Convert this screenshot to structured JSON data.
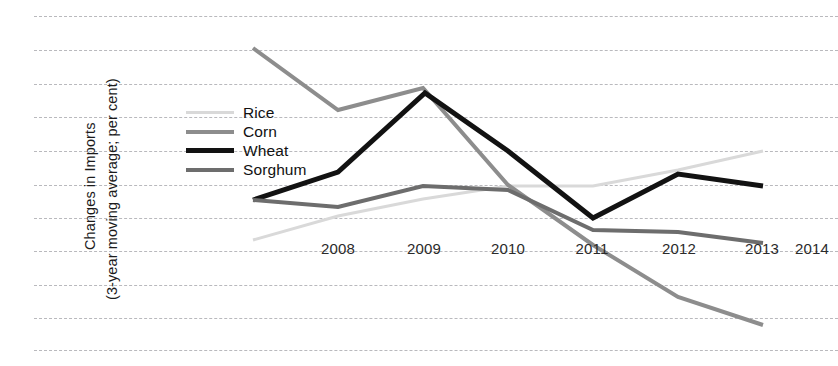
{
  "chart_data": {
    "type": "line",
    "title": "",
    "xlabel": "",
    "ylabel": "Changes in Imports (3-year moving average; per cent)",
    "ylabel_line1": "Changes in Imports",
    "ylabel_line2": "(3-year moving average; per cent)",
    "grid": true,
    "gridlines_y": [
      15,
      10,
      5,
      0,
      -5,
      -10,
      -15,
      -20,
      -25,
      -30,
      -35
    ],
    "ylim": [
      -37,
      17
    ],
    "legend_position": "inside-left",
    "categories": [
      "2007",
      "2008",
      "2009",
      "2010",
      "2011",
      "2012",
      "2013",
      "2014"
    ],
    "tick_labels": [
      "2008",
      "2009",
      "2010",
      "2011",
      "2012",
      "2013",
      "2014"
    ],
    "series": [
      {
        "name": "Rice",
        "color": "#d9d9d9",
        "width": 3,
        "x": [
          "2008",
          "2009",
          "2010",
          "2011",
          "2012",
          "2013",
          "2014"
        ],
        "values": [
          -16.5,
          -9.5,
          -4.5,
          -0.3,
          -0.3,
          2.0,
          5.0
        ]
      },
      {
        "name": "Corn",
        "color": "#8d8d8d",
        "width": 4,
        "x": [
          "2008",
          "2009",
          "2010",
          "2011",
          "2012",
          "2013",
          "2014"
        ],
        "values": [
          20.5,
          11.5,
          14.5,
          0.5,
          -8.5,
          -16.5,
          -21.0
        ]
      },
      {
        "name": "Wheat",
        "color": "#121212",
        "width": 5,
        "x": [
          "2008",
          "2009",
          "2010",
          "2011",
          "2012",
          "2013",
          "2014"
        ],
        "values": [
          -2.3,
          2.0,
          13.8,
          5.0,
          -5.0,
          1.6,
          0.0
        ]
      },
      {
        "name": "Sorghum",
        "color": "#6d6d6d",
        "width": 4,
        "x": [
          "2008",
          "2009",
          "2010",
          "2011",
          "2012",
          "2013",
          "2014"
        ],
        "values": [
          -2.3,
          -3.4,
          -0.3,
          -4.0,
          -7.0,
          -7.3,
          -8.7
        ]
      }
    ]
  },
  "axis": {
    "y_title_line1": "Changes in Imports",
    "y_title_line2": "(3-year moving average; per cent)",
    "ticks": [
      {
        "label": "2008",
        "x": 338
      },
      {
        "label": "2009",
        "x": 424
      },
      {
        "label": "2010",
        "x": 508
      },
      {
        "label": "2011",
        "x": 592
      },
      {
        "label": "2012",
        "x": 679
      },
      {
        "label": "2013",
        "x": 762
      },
      {
        "label": "2014",
        "x": 812
      }
    ],
    "tick_y": 240
  },
  "legend": {
    "items": [
      {
        "label": "Rice",
        "color": "#d9d9d9",
        "thickness": 3
      },
      {
        "label": "Corn",
        "color": "#8d8d8d",
        "thickness": 4
      },
      {
        "label": "Wheat",
        "color": "#121212",
        "thickness": 5
      },
      {
        "label": "Sorghum",
        "color": "#6d6d6d",
        "thickness": 4
      }
    ]
  },
  "geometry": {
    "gridline_px_y": [
      16,
      50,
      84,
      117,
      151,
      185,
      218,
      251,
      285,
      318,
      350
    ],
    "point_px_x": [
      253,
      338,
      423,
      508,
      593,
      678,
      763
    ],
    "series_px": {
      "Rice": [
        240,
        216,
        199,
        186,
        186,
        170,
        151
      ],
      "Corn": [
        48,
        110,
        88,
        185,
        245,
        297,
        325
      ],
      "Wheat": [
        200,
        172,
        93,
        151,
        218,
        174,
        186
      ],
      "Sorghum": [
        200,
        207,
        186,
        190,
        230,
        232,
        243
      ]
    },
    "wheat_peak_px": [
      425,
      93
    ]
  }
}
